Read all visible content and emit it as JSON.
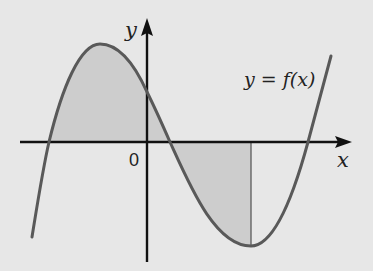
{
  "diagram": {
    "title": "",
    "labels": {
      "y_axis": "y",
      "x_axis": "x",
      "origin": "0",
      "function": "y = f(x)"
    },
    "colors": {
      "background": "#e7e7e7",
      "curve": "#595959",
      "axes": "#111111",
      "shaded_region": "#cdcdcd",
      "vertical_line": "#5a5a5a"
    },
    "geometry": {
      "x_axis_y": 142,
      "y_axis_x": 147,
      "x_axis_range_px": [
        20,
        352
      ],
      "y_axis_range_px": [
        18,
        262
      ],
      "curve_points_px": {
        "start": [
          32,
          237
        ],
        "left_root": [
          49,
          142
        ],
        "local_max": [
          100,
          44
        ],
        "y_intercept": [
          147,
          92
        ],
        "middle_root": [
          170,
          142
        ],
        "local_min": [
          251,
          246
        ],
        "right_root": [
          308,
          142
        ],
        "end": [
          331,
          56
        ]
      },
      "shaded_regions": [
        {
          "description": "area between curve and x-axis from left root to middle root (above axis)",
          "from_x": 49,
          "to_x": 170
        },
        {
          "description": "area between curve and x-axis from middle root to vertical line at local minimum (below axis)",
          "from_x": 170,
          "to_x": 251
        }
      ],
      "vertical_line_x": 251
    }
  }
}
